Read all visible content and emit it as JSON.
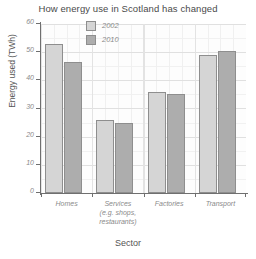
{
  "chart_data": {
    "type": "bar",
    "title": "How energy use in Scotland has changed",
    "xlabel": "Sector",
    "ylabel": "Energy used (TWh)",
    "categories": [
      "Homes",
      "Services\n(e.g. shops,\nrestaurants)",
      "Factories",
      "Transport"
    ],
    "category_lines": [
      [
        "Homes"
      ],
      [
        "Services",
        "(e.g. shops,",
        "restaurants)"
      ],
      [
        "Factories"
      ],
      [
        "Transport"
      ]
    ],
    "series": [
      {
        "name": "2002",
        "values": [
          53,
          26,
          36,
          49
        ],
        "color": "#d5d5d5"
      },
      {
        "name": "2010",
        "values": [
          46.5,
          25,
          35,
          50.5
        ],
        "color": "#adadad"
      }
    ],
    "legend": [
      "2002",
      "2010"
    ],
    "legend_position": "inside-top-center",
    "ylim": [
      0,
      60
    ],
    "yticks": [
      0,
      10,
      20,
      30,
      40,
      50,
      60
    ],
    "ytick_labels": [
      "0",
      "10",
      "20",
      "30",
      "40",
      "50",
      "60"
    ],
    "grid": true,
    "grid_minor": true
  }
}
